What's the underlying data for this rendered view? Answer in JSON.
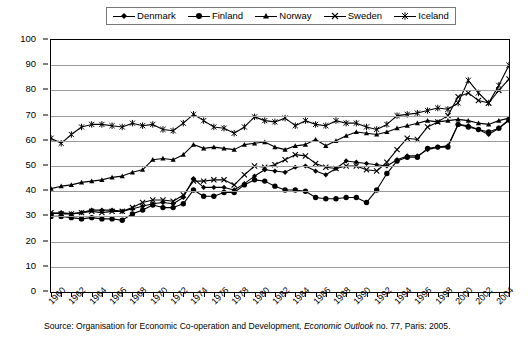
{
  "chart": {
    "type": "line",
    "ylabel": "(X+M)/GDP, percent",
    "source": "Source: Organisation for Economic Co-operation and Development, ",
    "source_italic": "Economic Outlook",
    "source_tail": " no. 77, Paris: 2005."
  },
  "legend": {
    "position": "top",
    "items": [
      {
        "label": "Denmark",
        "marker": "diamond"
      },
      {
        "label": "Finland",
        "marker": "circle"
      },
      {
        "label": "Norway",
        "marker": "triangle"
      },
      {
        "label": "Sweden",
        "marker": "cross"
      },
      {
        "label": "Iceland",
        "marker": "asterisk"
      }
    ]
  },
  "axes": {
    "y_ticks": [
      0,
      10,
      20,
      30,
      40,
      50,
      60,
      70,
      80,
      90,
      100
    ],
    "ylim": [
      0,
      100
    ],
    "grid": true,
    "x_tick_labels": [
      "1960",
      "1962",
      "1964",
      "1966",
      "1968",
      "1970",
      "1972",
      "1974",
      "1976",
      "1978",
      "1980",
      "1982",
      "1984",
      "1986",
      "1988",
      "1990",
      "1992",
      "1994",
      "1996",
      "1998",
      "2000",
      "2002",
      "2004"
    ],
    "xlim": [
      1960,
      2005
    ]
  },
  "chart_data": {
    "type": "line",
    "title": "",
    "xlabel": "",
    "ylabel": "(X+M)/GDP, percent",
    "ylim": [
      0,
      100
    ],
    "grid": true,
    "legend_position": "top",
    "x": [
      1960,
      1961,
      1962,
      1963,
      1964,
      1965,
      1966,
      1967,
      1968,
      1969,
      1970,
      1971,
      1972,
      1973,
      1974,
      1975,
      1976,
      1977,
      1978,
      1979,
      1980,
      1981,
      1982,
      1983,
      1984,
      1985,
      1986,
      1987,
      1988,
      1989,
      1990,
      1991,
      1992,
      1993,
      1994,
      1995,
      1996,
      1997,
      1998,
      1999,
      2000,
      2001,
      2002,
      2003,
      2004,
      2005
    ],
    "series": [
      {
        "name": "Denmark",
        "marker": "diamond",
        "values": [
          31.0,
          31.5,
          31.0,
          31.5,
          32.5,
          32.5,
          32.5,
          32.0,
          33.0,
          34.0,
          35.0,
          35.5,
          35.0,
          37.5,
          45.0,
          41.5,
          41.5,
          41.5,
          40.5,
          43.0,
          46.0,
          48.5,
          48.0,
          47.5,
          49.5,
          50.0,
          48.0,
          46.5,
          49.0,
          52.0,
          51.5,
          51.0,
          50.5,
          50.0,
          52.5,
          54.0,
          54.0,
          56.5,
          57.5,
          58.0,
          66.5,
          66.0,
          64.5,
          62.5,
          65.0,
          68.0
        ]
      },
      {
        "name": "Finland",
        "marker": "circle",
        "values": [
          30.0,
          30.0,
          29.5,
          29.0,
          29.5,
          29.0,
          29.0,
          28.5,
          31.0,
          32.5,
          34.5,
          33.5,
          33.5,
          35.0,
          40.5,
          38.0,
          38.0,
          39.5,
          39.5,
          42.5,
          44.5,
          44.0,
          42.0,
          40.5,
          40.5,
          40.0,
          37.5,
          37.0,
          37.0,
          37.5,
          37.5,
          35.5,
          40.5,
          47.0,
          52.0,
          53.5,
          53.5,
          57.0,
          57.5,
          57.5,
          66.5,
          65.5,
          64.5,
          63.5,
          65.0,
          68.5
        ]
      },
      {
        "name": "Norway",
        "marker": "triangle",
        "values": [
          41.0,
          42.0,
          42.5,
          43.5,
          44.0,
          44.5,
          45.5,
          46.0,
          47.5,
          48.5,
          52.5,
          53.0,
          52.5,
          54.5,
          58.5,
          57.0,
          57.5,
          57.0,
          56.5,
          58.5,
          59.0,
          59.5,
          57.5,
          56.5,
          58.0,
          58.5,
          60.5,
          58.0,
          60.0,
          62.0,
          63.5,
          63.0,
          62.5,
          63.5,
          65.0,
          66.0,
          67.0,
          68.0,
          67.5,
          68.0,
          68.5,
          68.0,
          67.0,
          66.5,
          68.0,
          69.0
        ]
      },
      {
        "name": "Sweden",
        "marker": "cross",
        "values": [
          31.5,
          31.0,
          31.0,
          31.5,
          32.0,
          31.5,
          32.0,
          32.0,
          33.5,
          35.5,
          36.5,
          36.5,
          36.0,
          38.5,
          44.0,
          44.0,
          44.5,
          44.5,
          42.5,
          46.5,
          50.0,
          49.5,
          50.5,
          52.5,
          54.5,
          54.0,
          51.0,
          49.5,
          49.0,
          50.0,
          50.0,
          48.5,
          48.0,
          51.5,
          56.5,
          61.0,
          60.5,
          65.5,
          67.5,
          70.0,
          77.5,
          79.0,
          76.0,
          75.0,
          80.0,
          84.5
        ]
      },
      {
        "name": "Iceland",
        "marker": "asterisk",
        "values": [
          61.0,
          59.0,
          62.5,
          65.5,
          66.5,
          66.5,
          66.0,
          65.5,
          67.0,
          66.0,
          66.5,
          64.5,
          64.0,
          67.0,
          70.5,
          68.0,
          65.5,
          65.0,
          63.0,
          65.5,
          69.5,
          68.0,
          67.5,
          69.0,
          66.0,
          68.0,
          66.5,
          66.0,
          68.0,
          67.0,
          67.0,
          65.5,
          64.5,
          66.5,
          70.0,
          70.5,
          71.0,
          72.0,
          73.0,
          72.5,
          75.0,
          84.0,
          79.0,
          75.0,
          82.0,
          90.0
        ]
      }
    ]
  }
}
